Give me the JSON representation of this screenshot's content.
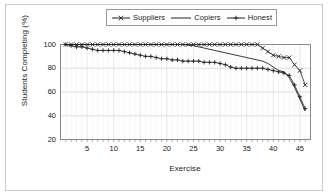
{
  "chart_data": {
    "type": "line",
    "title": "",
    "xlabel": "Exercise",
    "ylabel": "Students Completing (%)",
    "xlim": [
      0,
      47
    ],
    "ylim": [
      20,
      100
    ],
    "xticks": [
      5,
      10,
      15,
      20,
      25,
      30,
      35,
      40,
      45
    ],
    "yticks": [
      20,
      40,
      60,
      80,
      100
    ],
    "grid": true,
    "legend_position": "top-center",
    "x": [
      1,
      2,
      3,
      4,
      5,
      6,
      7,
      8,
      9,
      10,
      11,
      12,
      13,
      14,
      15,
      16,
      17,
      18,
      19,
      20,
      21,
      22,
      23,
      24,
      25,
      26,
      27,
      28,
      29,
      30,
      31,
      32,
      33,
      34,
      35,
      36,
      37,
      38,
      39,
      40,
      41,
      42,
      43,
      44,
      45,
      46
    ],
    "series": [
      {
        "name": "Suppliers",
        "marker": "x",
        "style": "solid",
        "values": [
          100,
          100,
          100,
          100,
          100,
          100,
          100,
          100,
          100,
          100,
          100,
          100,
          100,
          100,
          100,
          100,
          100,
          100,
          100,
          100,
          100,
          100,
          100,
          100,
          100,
          100,
          100,
          100,
          100,
          100,
          100,
          100,
          100,
          100,
          100,
          100,
          100,
          97,
          94,
          91,
          90,
          89,
          89,
          83,
          78,
          66
        ]
      },
      {
        "name": "Copiers",
        "marker": "none",
        "style": "solid",
        "values": [
          100,
          100,
          100,
          100,
          100,
          100,
          100,
          100,
          100,
          100,
          100,
          100,
          100,
          100,
          100,
          100,
          100,
          100,
          100,
          100,
          100,
          100,
          100,
          99.5,
          99,
          98,
          97,
          96,
          95,
          94,
          93,
          92,
          91,
          90,
          89,
          88,
          87,
          86,
          84,
          81,
          78,
          77,
          72,
          64,
          54,
          44
        ]
      },
      {
        "name": "Honest",
        "marker": "plus",
        "style": "solid",
        "values": [
          100,
          99,
          98,
          98,
          97,
          96,
          95,
          95,
          95,
          95,
          95,
          94,
          93,
          92,
          91,
          90,
          90,
          89,
          88,
          88,
          87,
          87,
          86,
          86,
          86,
          86,
          85,
          85,
          85,
          84,
          83,
          81,
          80,
          80,
          80,
          80,
          80,
          80,
          79,
          78,
          77,
          76,
          74,
          66,
          56,
          46
        ]
      }
    ]
  },
  "legend": {
    "items": [
      {
        "label": "Suppliers",
        "marker": "x"
      },
      {
        "label": "Copiers",
        "marker": "none"
      },
      {
        "label": "Honest",
        "marker": "plus"
      }
    ]
  },
  "colors": {
    "line": "#222222",
    "grid": "#cccccc",
    "axis": "#808080",
    "frame": "#c9c9c9",
    "text": "#1a1a1a"
  }
}
